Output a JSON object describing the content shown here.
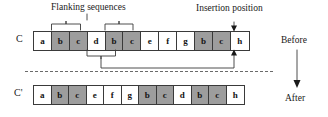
{
  "figure": {
    "title_text": "Flanking sequences",
    "insertion_text": "Insertion position",
    "before_text": "Before",
    "after_text": "After",
    "accent_color": "#9d9d9d",
    "line_color": "#3a3a3a"
  },
  "rows": {
    "before": {
      "name": "C",
      "cells": [
        {
          "label": "a",
          "shaded": false
        },
        {
          "label": "b",
          "shaded": true
        },
        {
          "label": "c",
          "shaded": true
        },
        {
          "label": "d",
          "shaded": false
        },
        {
          "label": "b",
          "shaded": true
        },
        {
          "label": "c",
          "shaded": true
        },
        {
          "label": "e",
          "shaded": false
        },
        {
          "label": "f",
          "shaded": false
        },
        {
          "label": "g",
          "shaded": false
        },
        {
          "label": "b",
          "shaded": true
        },
        {
          "label": "c",
          "shaded": true
        },
        {
          "label": "h",
          "shaded": false
        }
      ]
    },
    "after": {
      "name": "C'",
      "cells": [
        {
          "label": "a",
          "shaded": false
        },
        {
          "label": "b",
          "shaded": true
        },
        {
          "label": "c",
          "shaded": true
        },
        {
          "label": "e",
          "shaded": false
        },
        {
          "label": "f",
          "shaded": false
        },
        {
          "label": "g",
          "shaded": false
        },
        {
          "label": "b",
          "shaded": true
        },
        {
          "label": "c",
          "shaded": true
        },
        {
          "label": "d",
          "shaded": false
        },
        {
          "label": "b",
          "shaded": true
        },
        {
          "label": "c",
          "shaded": true
        },
        {
          "label": "h",
          "shaded": false
        }
      ]
    }
  },
  "annotations": {
    "brace_top_left": "flanking-sequence-brace-1",
    "brace_top_right": "flanking-sequence-brace-2",
    "brace_bottom": "moved-segment-brace",
    "connector": "insertion-connector",
    "insertion_arrow": "insertion-arrow",
    "transition_arrow": "before-after-arrow"
  }
}
